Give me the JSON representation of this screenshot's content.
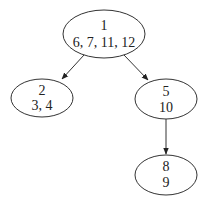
{
  "diagram": {
    "type": "tree",
    "nodes": [
      {
        "id": "n1",
        "line1": "1",
        "line2": "6, 7, 11, 12",
        "cx": 104,
        "cy": 34,
        "rx": 41,
        "ry": 24
      },
      {
        "id": "n2",
        "line1": "2",
        "line2": "3, 4",
        "cx": 42,
        "cy": 98,
        "rx": 31,
        "ry": 19
      },
      {
        "id": "n5",
        "line1": "5",
        "line2": "10",
        "cx": 166,
        "cy": 99,
        "rx": 31,
        "ry": 20
      },
      {
        "id": "n8",
        "line1": "8",
        "line2": "9",
        "cx": 166,
        "cy": 175,
        "rx": 31,
        "ry": 20
      }
    ],
    "edges": [
      {
        "from": "n1",
        "to": "n2"
      },
      {
        "from": "n1",
        "to": "n5"
      },
      {
        "from": "n5",
        "to": "n8"
      }
    ],
    "colors": {
      "stroke": "#333333",
      "text": "#222222",
      "background": "#ffffff"
    }
  }
}
